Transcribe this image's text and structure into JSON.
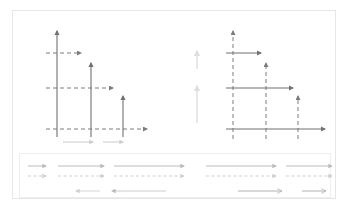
{
  "page": {
    "background": "#ffffff",
    "card_border_color": "#e6e6e8",
    "inner_border_color": "#eeeef0"
  },
  "colors": {
    "solid_dark": "#6f7176",
    "dashed_dark": "#7a7c81",
    "faint_gray": "#c9cbd0",
    "very_faint_gray": "#dcdee2",
    "legend_gray": "#b9bbc1",
    "legend_light": "#d4d6da",
    "open_arrow": "#b0b2b8"
  },
  "chart_data": {
    "type": "diagram",
    "panels": [
      {
        "id": "left-diagram",
        "name": "vertical-solid-horizontal-dashed",
        "description": "Three vertical solid up-arrows of decreasing height crossed by three horizontal dashed right-arrows at decreasing levels",
        "solid_orientation": "vertical",
        "dashed_orientation": "horizontal",
        "vertical_arrows": [
          {
            "x": 44,
            "y_base": 118,
            "y_tip": 20,
            "length": 98
          },
          {
            "x": 78,
            "y_base": 118,
            "y_tip": 52,
            "length": 66
          },
          {
            "x": 110,
            "y_base": 118,
            "y_tip": 85,
            "length": 33
          }
        ],
        "horizontal_dashed_arrows": [
          {
            "y": 42,
            "x_start": 33,
            "x_tip": 68,
            "length": 35
          },
          {
            "y": 77,
            "x_start": 33,
            "x_tip": 100,
            "length": 67
          },
          {
            "y": 118,
            "x_start": 33,
            "x_tip": 134,
            "length": 101
          }
        ]
      },
      {
        "id": "middle-faint-column",
        "name": "faint-vertical-arrows",
        "description": "Two very faint short vertical up-arrows stacked in the middle gutter",
        "arrows": [
          {
            "x": 184,
            "y_base": 58,
            "y_tip": 40,
            "length": 18
          },
          {
            "x": 184,
            "y_base": 112,
            "y_tip": 75,
            "length": 37
          }
        ]
      },
      {
        "id": "right-diagram",
        "name": "horizontal-solid-vertical-dashed",
        "description": "Three horizontal solid right-arrows of increasing length crossed by three vertical dashed up-arrows at decreasing heights",
        "solid_orientation": "horizontal",
        "dashed_orientation": "vertical",
        "horizontal_arrows": [
          {
            "y": 42,
            "x_start": 213,
            "x_tip": 248,
            "length": 35
          },
          {
            "y": 77,
            "x_start": 213,
            "x_tip": 280,
            "length": 67
          },
          {
            "y": 118,
            "x_start": 213,
            "x_tip": 312,
            "length": 99
          }
        ],
        "vertical_dashed_arrows": [
          {
            "x": 220,
            "y_base": 125,
            "y_tip": 20,
            "length": 105
          },
          {
            "x": 253,
            "y_base": 125,
            "y_tip": 52,
            "length": 73
          },
          {
            "x": 285,
            "y_base": 125,
            "y_tip": 85,
            "length": 40
          }
        ]
      }
    ],
    "mid_legend": {
      "id": "mid-legend",
      "name": "faint-arrow-legend",
      "items": [
        {
          "x_start": 50,
          "x_tip": 80,
          "y": 131,
          "style": "solid",
          "length": 30
        },
        {
          "x_start": 90,
          "x_tip": 110,
          "y": 131,
          "style": "solid",
          "length": 20
        }
      ]
    },
    "legend_strip": {
      "id": "legend-strip",
      "name": "arrow-style-legend",
      "left_group": {
        "name": "left-legend-group",
        "solid_row_y": 12,
        "dashed_row_y": 22,
        "arrows": [
          {
            "x_start": 14,
            "x_tip": 32,
            "length": 18
          },
          {
            "x_start": 44,
            "x_tip": 90,
            "length": 46
          },
          {
            "x_start": 100,
            "x_tip": 170,
            "length": 70
          }
        ],
        "reverse_row_y": 37,
        "reverse_arrows": [
          {
            "x_tip": 62,
            "x_start": 86,
            "length": 24
          },
          {
            "x_tip": 98,
            "x_start": 152,
            "length": 54
          }
        ]
      },
      "right_group": {
        "name": "right-legend-group",
        "solid_row_y": 12,
        "dashed_row_y": 22,
        "arrows": [
          {
            "x_start": 192,
            "x_tip": 262,
            "length": 70
          },
          {
            "x_start": 272,
            "x_tip": 318,
            "length": 46
          },
          {
            "x_start": 328,
            "x_tip": 346,
            "length": 18
          }
        ],
        "open_row_y": 37,
        "open_arrows": [
          {
            "x_start": 224,
            "x_tip": 268,
            "length": 44
          },
          {
            "x_start": 288,
            "x_tip": 312,
            "length": 24
          }
        ]
      }
    }
  }
}
